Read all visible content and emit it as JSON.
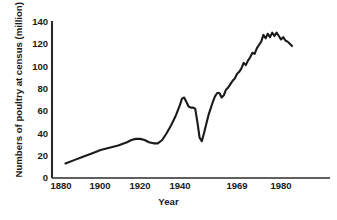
{
  "chart_data": {
    "type": "line",
    "title": "",
    "xlabel": "Year",
    "ylabel": "Numbers of poultry at census (million)",
    "xlim": [
      1880,
      1986
    ],
    "ylim": [
      0,
      140
    ],
    "grid": false,
    "legend": null,
    "xticks": [
      "1880",
      "1900",
      "1920",
      "1940",
      "1969",
      "1980"
    ],
    "xtick_values": [
      1880,
      1900,
      1920,
      1940,
      1969,
      1980
    ],
    "yticks": [
      "0",
      "20",
      "40",
      "60",
      "80",
      "100",
      "120",
      "140"
    ],
    "ytick_values": [
      0,
      20,
      40,
      60,
      80,
      100,
      120,
      140
    ],
    "series": [
      {
        "name": "Poultry at census",
        "color": "#1a1a1a",
        "x": [
          1882,
          1886,
          1890,
          1894,
          1898,
          1902,
          1906,
          1910,
          1912,
          1914,
          1916,
          1918,
          1920,
          1922,
          1924,
          1926,
          1928,
          1930,
          1932,
          1934,
          1935,
          1936,
          1937,
          1938,
          1939,
          1940,
          1941,
          1942,
          1943,
          1944,
          1945,
          1946,
          1947,
          1948,
          1949,
          1950,
          1951,
          1952,
          1953,
          1954,
          1955,
          1956,
          1957,
          1958,
          1959,
          1960,
          1961,
          1962,
          1963,
          1964,
          1965,
          1966,
          1967,
          1968,
          1969,
          1970,
          1971,
          1972,
          1973,
          1974,
          1975,
          1976,
          1977,
          1978,
          1979,
          1980,
          1981,
          1982,
          1983,
          1984,
          1985
        ],
        "y": [
          13,
          16,
          19,
          22,
          25,
          27,
          29,
          32,
          34,
          35,
          35,
          34,
          32,
          31,
          31,
          34,
          40,
          47,
          55,
          65,
          71,
          72,
          68,
          64,
          63,
          63,
          62,
          50,
          36,
          33,
          40,
          48,
          56,
          62,
          68,
          73,
          76,
          76,
          72,
          74,
          79,
          81,
          84,
          87,
          89,
          93,
          95,
          98,
          103,
          101,
          105,
          108,
          112,
          111,
          116,
          119,
          122,
          128,
          125,
          129,
          126,
          130,
          127,
          130,
          127,
          124,
          126,
          123,
          122,
          120,
          118
        ]
      }
    ]
  },
  "axes": {
    "y_title": "Numbers of poultry at census (million)",
    "x_title": "Year"
  }
}
